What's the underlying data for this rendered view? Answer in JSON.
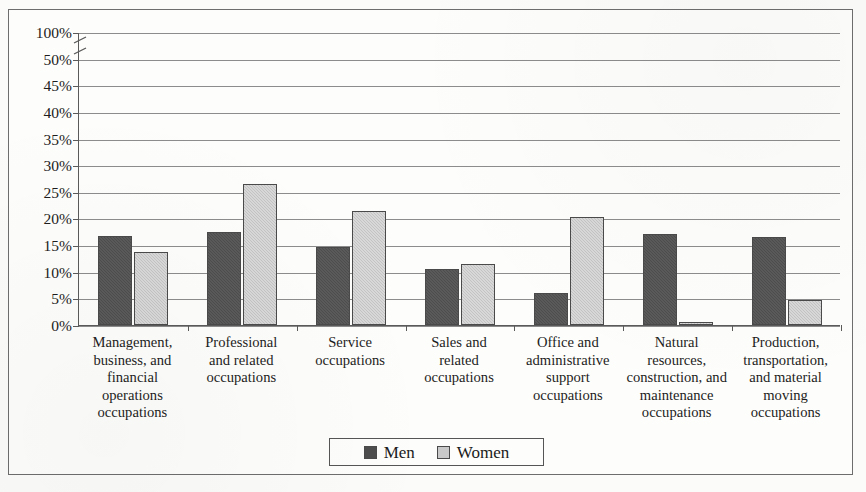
{
  "chart_data": {
    "type": "bar",
    "title": "",
    "subtitle": "",
    "xlabel": "",
    "ylabel": "",
    "grid": true,
    "legend_position": "bottom-center",
    "axis_note": "y-axis has a scale break between 50% and 100%",
    "ylim": [
      0,
      100
    ],
    "ytick_labels": [
      "100%",
      "50%",
      "45%",
      "40%",
      "35%",
      "30%",
      "25%",
      "20%",
      "15%",
      "10%",
      "5%",
      "0%"
    ],
    "ytick_values": [
      100,
      50,
      45,
      40,
      35,
      30,
      25,
      20,
      15,
      10,
      5,
      0
    ],
    "categories": [
      "Management, business, and financial operations occupations",
      "Professional and related occupations",
      "Service occupations",
      "Sales and related occupations",
      "Office and administrative support occupations",
      "Natural resources, construction, and maintenance occupations",
      "Production, transportation, and material moving occupations"
    ],
    "category_label_lines": [
      [
        "Management,",
        "business, and",
        "financial",
        "operations",
        "occupations"
      ],
      [
        "Professional",
        "and related",
        "occupations"
      ],
      [
        "Service",
        "occupations"
      ],
      [
        "Sales and",
        "related",
        "occupations"
      ],
      [
        "Office and",
        "administrative",
        "support",
        "occupations"
      ],
      [
        "Natural",
        "resources,",
        "construction, and",
        "maintenance",
        "occupations"
      ],
      [
        "Production,",
        "transportation,",
        "and material",
        "moving",
        "occupations"
      ]
    ],
    "series": [
      {
        "name": "Men",
        "color": "#4d4d4d",
        "values": [
          16.7,
          17.4,
          14.6,
          10.5,
          6.1,
          17.1,
          16.5
        ]
      },
      {
        "name": "Women",
        "color": "#c3c3c3",
        "values": [
          13.7,
          26.4,
          21.4,
          11.5,
          20.3,
          0.6,
          4.7
        ]
      }
    ]
  },
  "legend": {
    "entries": [
      {
        "label": "Men",
        "swatch": "men"
      },
      {
        "label": "Women",
        "swatch": "women"
      }
    ]
  }
}
